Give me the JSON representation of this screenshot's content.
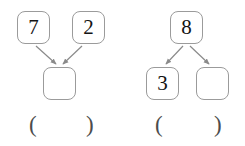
{
  "worksheet": {
    "background_color": "#ffffff",
    "box_border_color": "#9b9b9b",
    "arrow_color": "#8a8a8a",
    "text_color": "#141414",
    "paren_color": "#4c4c4c",
    "groups": [
      {
        "id": "left-group",
        "kind": "addition-number-bond",
        "direction": "converging",
        "top_boxes": [
          {
            "id": "left-addend-1",
            "value": "7",
            "empty": false
          },
          {
            "id": "left-addend-2",
            "value": "2",
            "empty": false
          }
        ],
        "bottom_boxes": [
          {
            "id": "left-sum",
            "value": "",
            "empty": true
          }
        ],
        "answer_slot": {
          "open_paren": "(",
          "close_paren": ")",
          "value": ""
        }
      },
      {
        "id": "right-group",
        "kind": "decomposition-number-bond",
        "direction": "diverging",
        "top_boxes": [
          {
            "id": "right-whole",
            "value": "8",
            "empty": false
          }
        ],
        "bottom_boxes": [
          {
            "id": "right-part-1",
            "value": "3",
            "empty": false
          },
          {
            "id": "right-part-2",
            "value": "",
            "empty": true
          }
        ],
        "answer_slot": {
          "open_paren": "(",
          "close_paren": ")",
          "value": ""
        }
      }
    ]
  }
}
